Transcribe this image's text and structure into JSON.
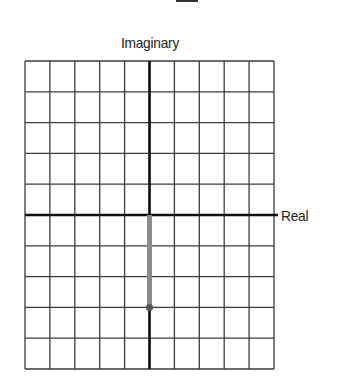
{
  "diagram": {
    "type": "complex-plane",
    "top_mark": "_",
    "labels": {
      "imaginary_axis": "Imaginary",
      "real_axis": "Real"
    },
    "grid": {
      "columns": 10,
      "rows": 10,
      "x_range": [
        -5,
        5
      ],
      "y_range": [
        -5,
        5
      ],
      "left_px": 25,
      "top_px": 61,
      "right_px": 274,
      "bottom_px": 369
    },
    "vector": {
      "from": {
        "re": 0,
        "im": 0
      },
      "to": {
        "re": 0,
        "im": -3
      },
      "color": "#8a8a8a",
      "endpoint_color": "#555555"
    },
    "colors": {
      "grid_line": "#3a3a3a",
      "axis_line": "#111111",
      "background": "#ffffff"
    }
  }
}
